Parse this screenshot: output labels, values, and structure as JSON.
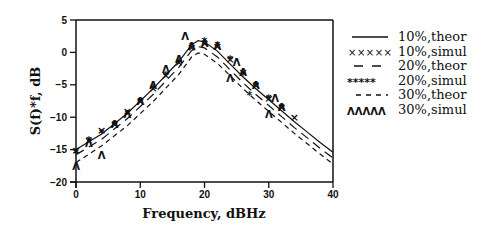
{
  "chart_data": {
    "type": "line",
    "title": "",
    "xlabel": "Frequency,  dBHz",
    "ylabel": "S(f)*f,  dB",
    "xlim": [
      0,
      40
    ],
    "ylim": [
      -20,
      5
    ],
    "xticks": [
      0,
      10,
      20,
      30,
      40
    ],
    "yticks": [
      5,
      0,
      -5,
      -10,
      -15,
      -20
    ],
    "grid": false,
    "legend_position": "right outside",
    "series": [
      {
        "name": "10%,theor",
        "style": "solid",
        "x": [
          0,
          4,
          8,
          12,
          16,
          18,
          19,
          20,
          22,
          24,
          26,
          28,
          30,
          32,
          34,
          36,
          38,
          40
        ],
        "y": [
          -15,
          -12.6,
          -9.4,
          -5.6,
          -1.4,
          1.2,
          1.8,
          1.6,
          0.2,
          -1.8,
          -3.8,
          -5.6,
          -7.3,
          -9,
          -10.7,
          -12.3,
          -13.9,
          -15.4
        ]
      },
      {
        "name": "10%,simul",
        "style": "x-marker",
        "x": [
          0,
          2,
          4,
          6,
          8,
          10,
          12,
          14,
          16,
          18,
          20,
          22,
          24,
          26,
          28,
          30,
          32,
          34
        ],
        "y": [
          -15,
          -13.5,
          -12,
          -11,
          -9,
          -7.5,
          -5.5,
          -3.5,
          -1.5,
          0.8,
          1.5,
          1,
          -1,
          -3,
          -5,
          -7,
          -8.5,
          -10
        ]
      },
      {
        "name": "20%,theor",
        "style": "long-dash",
        "x": [
          0,
          4,
          8,
          12,
          16,
          18,
          19,
          20,
          22,
          24,
          26,
          28,
          30,
          32,
          34,
          36,
          38,
          40
        ],
        "y": [
          -15.8,
          -13.4,
          -10.2,
          -6.5,
          -2.3,
          0.3,
          0.9,
          0.7,
          -0.7,
          -2.7,
          -4.7,
          -6.5,
          -8.2,
          -9.9,
          -11.6,
          -13.2,
          -14.8,
          -16.3
        ]
      },
      {
        "name": "20%,simul",
        "style": "star-marker",
        "x": [
          0,
          2,
          4,
          6,
          8,
          10,
          12,
          14,
          16,
          18,
          20,
          22,
          24,
          26,
          27,
          28,
          30,
          32
        ],
        "y": [
          -15.5,
          -13.5,
          -12.5,
          -11,
          -9.5,
          -7.5,
          -5.5,
          -3.5,
          -1.5,
          1,
          1.8,
          1.2,
          -1,
          -3.5,
          -6.5,
          -5,
          -7,
          -8.5
        ]
      },
      {
        "name": "30%,theor",
        "style": "short-dash",
        "x": [
          0,
          4,
          8,
          12,
          16,
          18,
          19,
          20,
          22,
          24,
          26,
          28,
          30,
          32,
          34,
          36,
          38,
          40
        ],
        "y": [
          -17,
          -14.4,
          -11.3,
          -7.6,
          -3.4,
          -0.7,
          -0.1,
          -0.3,
          -1.7,
          -3.6,
          -5.6,
          -7.4,
          -9.1,
          -10.8,
          -12.5,
          -14.1,
          -15.7,
          -17.2
        ]
      },
      {
        "name": "30%,simul",
        "style": "arch-marker",
        "x": [
          0,
          2,
          4,
          6,
          8,
          10,
          12,
          14,
          16,
          17,
          18,
          20,
          22,
          24,
          25,
          26,
          28,
          30,
          31,
          32
        ],
        "y": [
          -17.5,
          -14,
          -15.8,
          -11,
          -9.5,
          -7.5,
          -5,
          -2.5,
          -1,
          2.5,
          1,
          1.5,
          1,
          -4,
          -1.5,
          -3,
          -5,
          -9.5,
          -7,
          -8.5
        ]
      }
    ]
  },
  "legend": {
    "items": [
      {
        "label": "10%,theor",
        "symbol": "solid-line"
      },
      {
        "label": "10%,simul",
        "symbol": "×××××"
      },
      {
        "label": "20%,theor",
        "symbol": "long-dash-line"
      },
      {
        "label": "20%,simul",
        "symbol": "*****"
      },
      {
        "label": "30%,theor",
        "symbol": "short-dash-line"
      },
      {
        "label": "30%,simul",
        "symbol": "ΛΛΛΛΛ"
      }
    ]
  }
}
